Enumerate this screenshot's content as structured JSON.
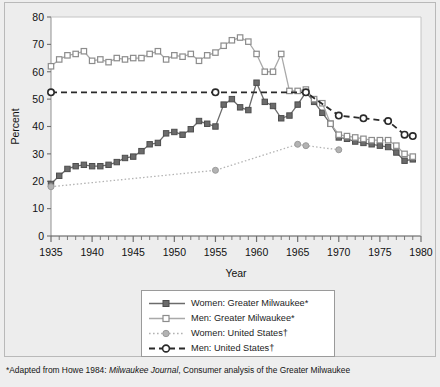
{
  "figure": {
    "background_color": "#ededed",
    "plot_background_color": "#ffffff",
    "border_color": "#b9b9b9"
  },
  "footnote": {
    "marker": "*",
    "text_before_italic": "Adapted from Howe 1984: ",
    "italic_text": "Milwaukee Journal",
    "text_after_italic": ", Consumer analysis of the Greater Milwaukee"
  },
  "legend": {
    "entries": [
      {
        "label": "Women: Greater Milwaukee*",
        "color": "#6b6b6b",
        "marker": "square-filled",
        "line": "solid",
        "swatch_name": "legend-swatch-women-milwaukee"
      },
      {
        "label": "Men: Greater Milwaukee*",
        "color": "#a9a9a9",
        "marker": "square-open",
        "line": "solid",
        "swatch_name": "legend-swatch-men-milwaukee"
      },
      {
        "label": "Women: United States†",
        "color": "#b3b3b3",
        "marker": "circle-filled",
        "line": "dotted",
        "swatch_name": "legend-swatch-women-us"
      },
      {
        "label": "Men: United States†",
        "color": "#2a2a2a",
        "marker": "circle-open",
        "line": "dashed",
        "swatch_name": "legend-swatch-men-us"
      }
    ]
  },
  "chart_data": {
    "type": "line",
    "title": "",
    "xlabel": "Year",
    "ylabel": "Percent",
    "xlim": [
      1935,
      1980
    ],
    "ylim": [
      0,
      80
    ],
    "ytick_step": 10,
    "yticks": [
      0,
      10,
      20,
      30,
      40,
      50,
      60,
      70,
      80
    ],
    "xticks": [
      1935,
      1940,
      1945,
      1950,
      1955,
      1960,
      1965,
      1970,
      1975,
      1980
    ],
    "xminor_step": 1,
    "grid": false,
    "legend_position": "below",
    "series": [
      {
        "name": "Women: Greater Milwaukee*",
        "color": "#6b6b6b",
        "marker": "square-filled",
        "line": "solid",
        "x": [
          1935,
          1936,
          1937,
          1938,
          1939,
          1940,
          1941,
          1942,
          1943,
          1944,
          1945,
          1946,
          1947,
          1948,
          1949,
          1950,
          1951,
          1952,
          1953,
          1954,
          1955,
          1956,
          1957,
          1958,
          1959,
          1960,
          1961,
          1962,
          1963,
          1964,
          1965,
          1966,
          1967,
          1968,
          1969,
          1970,
          1971,
          1972,
          1973,
          1974,
          1975,
          1976,
          1977,
          1978,
          1979
        ],
        "values": [
          19,
          22,
          24.5,
          25.5,
          26,
          25.5,
          25.5,
          26,
          27,
          28.5,
          29,
          31,
          33.5,
          34,
          37.5,
          38,
          37,
          39,
          42,
          41,
          40,
          48,
          50,
          47,
          46,
          56,
          49,
          47.5,
          43,
          44,
          48,
          52.5,
          49,
          45,
          41,
          36,
          35.5,
          34.5,
          34,
          33.5,
          33,
          32.5,
          30.5,
          27.5,
          28
        ]
      },
      {
        "name": "Men: Greater Milwaukee*",
        "color": "#a9a9a9",
        "marker": "square-open",
        "line": "solid",
        "x": [
          1935,
          1936,
          1937,
          1938,
          1939,
          1940,
          1941,
          1942,
          1943,
          1944,
          1945,
          1946,
          1947,
          1948,
          1949,
          1950,
          1951,
          1952,
          1953,
          1954,
          1955,
          1956,
          1957,
          1958,
          1959,
          1960,
          1961,
          1962,
          1963,
          1964,
          1965,
          1966,
          1967,
          1968,
          1969,
          1970,
          1971,
          1972,
          1973,
          1974,
          1975,
          1976,
          1977,
          1978,
          1979
        ],
        "values": [
          62,
          64.5,
          66,
          66.5,
          67.5,
          64,
          64.5,
          63.5,
          65,
          64.5,
          65,
          65,
          66.5,
          67.5,
          64.5,
          66,
          65.5,
          66.5,
          64,
          66,
          67,
          69.5,
          71.5,
          72.5,
          71,
          66.5,
          60,
          60,
          66.5,
          53,
          53,
          53.5,
          50,
          48.5,
          41,
          37,
          36.5,
          36,
          35.5,
          35,
          35,
          35,
          33,
          30,
          29
        ]
      },
      {
        "name": "Women: United States†",
        "color": "#b3b3b3",
        "marker": "circle-filled",
        "line": "dotted",
        "x": [
          1935,
          1955,
          1965,
          1966,
          1970
        ],
        "values": [
          18,
          24,
          33.5,
          33,
          31.5
        ]
      },
      {
        "name": "Men: United States†",
        "color": "#2a2a2a",
        "marker": "circle-open",
        "line": "dashed",
        "x": [
          1935,
          1955,
          1966,
          1970,
          1973,
          1976,
          1978,
          1979
        ],
        "values": [
          52.5,
          52.5,
          52.5,
          44,
          43,
          42,
          37,
          36.5
        ]
      }
    ]
  }
}
